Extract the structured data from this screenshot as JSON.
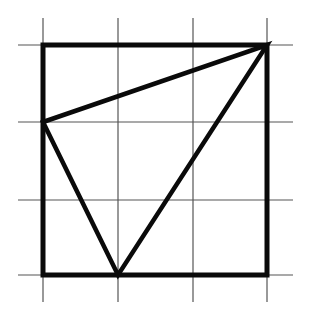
{
  "figure": {
    "colors": {
      "background": "#ffffff",
      "grid_line": "#555555",
      "bold_line": "#0a0a0a"
    },
    "grid": {
      "x_lines": [
        43,
        118,
        193,
        267
      ],
      "y_lines": [
        45,
        122,
        200,
        275
      ],
      "extent_x": [
        18,
        293
      ],
      "extent_y": [
        18,
        302
      ],
      "stroke_width": 1.2
    },
    "square": {
      "points": [
        [
          43,
          45
        ],
        [
          267,
          45
        ],
        [
          267,
          275
        ],
        [
          43,
          275
        ]
      ],
      "stroke_width": 5
    },
    "triangle": {
      "points": [
        [
          43,
          122
        ],
        [
          267,
          45
        ],
        [
          118,
          275
        ]
      ],
      "stroke_width": 4.5
    }
  }
}
